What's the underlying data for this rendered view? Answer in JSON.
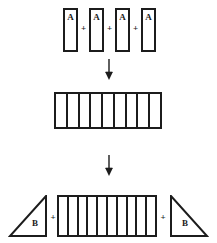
{
  "figure": {
    "stroke_color": "#1c1c1c",
    "background_color": "#ffffff"
  },
  "row_top": {
    "name": "four-unit-rectangles",
    "operator": "+",
    "units": [
      {
        "label": "A"
      },
      {
        "label": "A"
      },
      {
        "label": "A"
      },
      {
        "label": "A"
      }
    ]
  },
  "arrows": [
    {
      "name": "arrow-1",
      "direction": "down",
      "glyph": "↓"
    },
    {
      "name": "arrow-2",
      "direction": "down",
      "glyph": "↓"
    }
  ],
  "row_middle": {
    "name": "merged-strip",
    "cell_count": 9,
    "cells": [
      1,
      2,
      3,
      4,
      5,
      6,
      7,
      8,
      9
    ]
  },
  "row_bottom": {
    "name": "strip-with-triangles",
    "operator": "+",
    "left_triangle": {
      "label": "B",
      "right_angle": "bottom-right"
    },
    "right_triangle": {
      "label": "B",
      "right_angle": "bottom-left"
    },
    "strip": {
      "cell_count": 10,
      "cells": [
        1,
        2,
        3,
        4,
        5,
        6,
        7,
        8,
        9,
        10
      ]
    }
  }
}
